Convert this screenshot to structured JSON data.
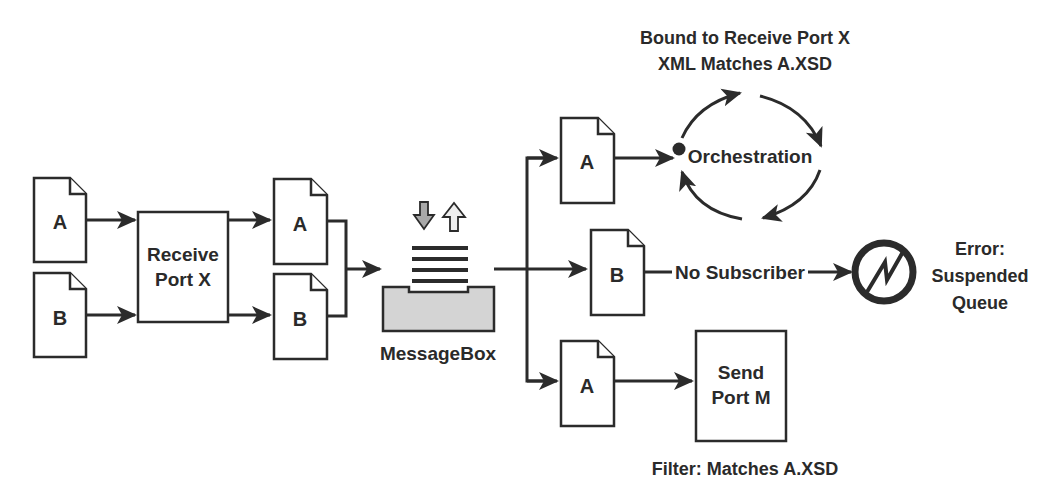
{
  "diagram": {
    "colors": {
      "ink": "#2b2b2b",
      "messagebox_fill": "#d4d4d4",
      "down_arrow_fill": "#a8a8a8",
      "up_arrow_fill": "#eeeeee",
      "background": "#ffffff"
    },
    "inputs": [
      {
        "label": "A"
      },
      {
        "label": "B"
      }
    ],
    "receive_port": {
      "line1": "Receive",
      "line2": "Port X"
    },
    "outputs": [
      {
        "label": "A"
      },
      {
        "label": "B"
      }
    ],
    "messagebox": {
      "label": "MessageBox"
    },
    "routes": [
      {
        "doc": "A",
        "target": "Orchestration"
      },
      {
        "doc": "B",
        "target": "Error: Suspended Queue",
        "edge_label": "No Subscriber"
      },
      {
        "doc": "A",
        "target": "Send Port M"
      }
    ],
    "orchestration": {
      "label": "Orchestration",
      "caption_line1": "Bound to Receive Port X",
      "caption_line2": "XML Matches A.XSD"
    },
    "no_subscriber": {
      "label": "No Subscriber"
    },
    "error": {
      "line1": "Error:",
      "line2": "Suspended",
      "line3": "Queue"
    },
    "send_port": {
      "line1": "Send",
      "line2": "Port M",
      "caption": "Filter: Matches A.XSD"
    }
  }
}
